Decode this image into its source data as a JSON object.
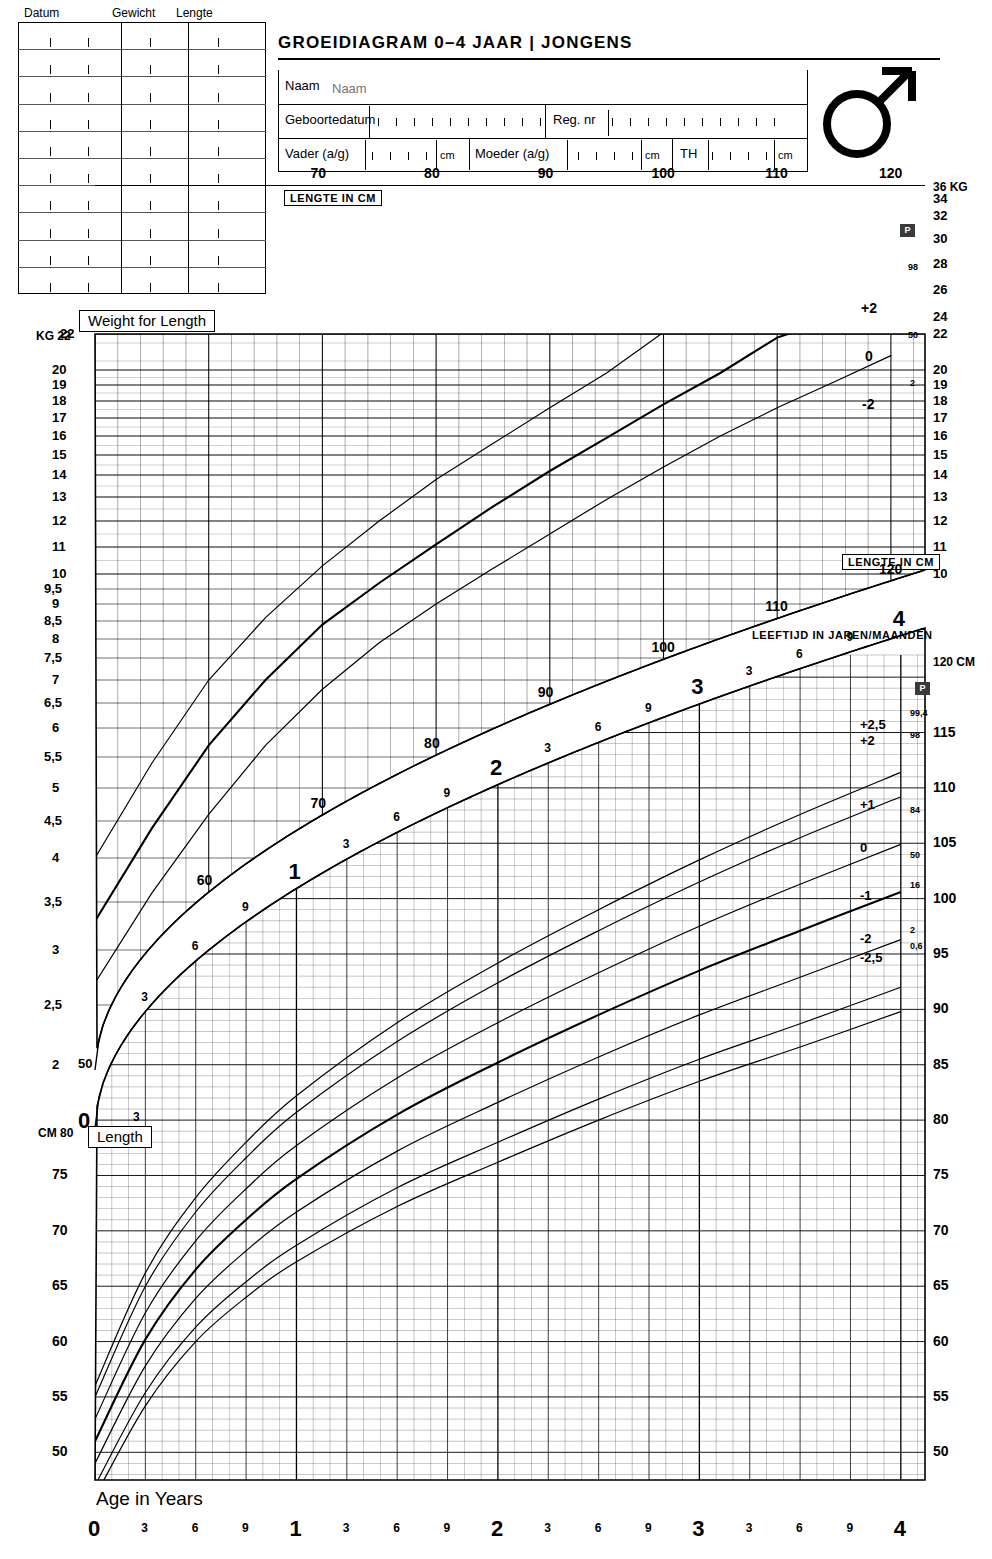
{
  "header": {
    "title": "GROEIDIAGRAM 0–4 JAAR  |  JONGENS",
    "sex_symbol": "male-symbol",
    "fields": [
      {
        "label": "Naam"
      },
      {
        "label": "Geboortedatum"
      },
      {
        "label": "Reg. nr"
      },
      {
        "label": "Vader (a/g)",
        "unit": "cm"
      },
      {
        "label": "Moeder (a/g)",
        "unit": "cm"
      },
      {
        "label": "TH",
        "unit": "cm"
      }
    ]
  },
  "record_table": {
    "columns": [
      "Datum",
      "Gewicht",
      "Lengte"
    ],
    "rows": 10,
    "values": []
  },
  "labels": {
    "weight_for_length": "Weight for Length",
    "length": "Length",
    "age_in_years": "Age in Years",
    "lengte_in_cm": "LENGTE IN CM",
    "leeftijd": "LEEFTIJD IN JAREN/MAANDEN",
    "p_badge": "P",
    "kg_unit": "KG",
    "cm_unit": "CM",
    "kg_top": "36 KG",
    "cm_top": "120 CM",
    "cm_left": "CM 80",
    "kg_left": "KG 22"
  },
  "chart_data": {
    "type": "line",
    "title": "GROEIDIAGRAM 0–4 JAAR | JONGENS",
    "panels": [
      {
        "name": "weight-for-length",
        "title": "Weight for Length",
        "xlabel": "LENGTE IN CM",
        "ylabel": "KG",
        "xlim": [
          50,
          123
        ],
        "xticks": [
          70,
          80,
          90,
          100,
          110,
          120
        ],
        "ytick_labels": [
          "2",
          "2,5",
          "3",
          "3,5",
          "4",
          "4,5",
          "5",
          "5,5",
          "6",
          "6,5",
          "7",
          "7,5",
          "8",
          "8,5",
          "9",
          "9,5",
          "10",
          "11",
          "12",
          "13",
          "14",
          "15",
          "16",
          "17",
          "18",
          "19",
          "20",
          "22"
        ],
        "ytick_right": [
          "10",
          "11",
          "12",
          "13",
          "14",
          "15",
          "16",
          "17",
          "18",
          "19",
          "20",
          "22",
          "24",
          "26",
          "28",
          "30",
          "32",
          "34",
          "36"
        ],
        "series": [
          {
            "name": "+2",
            "percentile": "98",
            "x": [
              50,
              55,
              60,
              65,
              70,
              75,
              80,
              85,
              90,
              95,
              100,
              105,
              110,
              115,
              120
            ],
            "y": [
              4.0,
              5.4,
              7.0,
              8.6,
              10.3,
              12.0,
              13.8,
              15.6,
              17.6,
              19.8,
              22.2,
              24.8,
              27.4,
              30.0,
              32.4
            ]
          },
          {
            "name": "0",
            "percentile": "50",
            "x": [
              50,
              55,
              60,
              65,
              70,
              75,
              80,
              85,
              90,
              95,
              100,
              105,
              110,
              115,
              120
            ],
            "y": [
              3.3,
              4.4,
              5.7,
              7.0,
              8.4,
              9.7,
              11.1,
              12.6,
              14.2,
              15.9,
              17.8,
              19.8,
              21.8,
              23.8,
              25.8
            ]
          },
          {
            "name": "-2",
            "percentile": "2",
            "x": [
              50,
              55,
              60,
              65,
              70,
              75,
              80,
              85,
              90,
              95,
              100,
              105,
              110,
              115,
              120
            ],
            "y": [
              2.7,
              3.6,
              4.6,
              5.7,
              6.8,
              7.9,
              9.0,
              10.2,
              11.5,
              12.9,
              14.4,
              16.0,
              17.6,
              19.2,
              20.8
            ]
          }
        ]
      },
      {
        "name": "length-for-age",
        "title": "Length",
        "xlabel": "Age in Years",
        "ylabel": "CM",
        "xlim": [
          0,
          4
        ],
        "xticks": [
          0,
          0.25,
          0.5,
          0.75,
          1,
          1.25,
          1.5,
          1.75,
          2,
          2.25,
          2.5,
          2.75,
          3,
          3.25,
          3.5,
          3.75,
          4
        ],
        "xtick_labels": [
          "0",
          "3",
          "6",
          "9",
          "1",
          "3",
          "6",
          "9",
          "2",
          "3",
          "6",
          "9",
          "3",
          "3",
          "6",
          "9",
          "4"
        ],
        "ylim": [
          47,
          122
        ],
        "yticks_left": [
          50,
          55,
          60,
          65,
          70,
          75,
          80
        ],
        "yticks_right": [
          50,
          55,
          60,
          65,
          70,
          75,
          80,
          85,
          90,
          95,
          100,
          105,
          110,
          115,
          120
        ],
        "series": [
          {
            "name": "+2,5",
            "percentile": "99,4",
            "x": [
              0,
              0.25,
              0.5,
              0.75,
              1,
              1.5,
              2,
              2.5,
              3,
              3.5,
              4
            ],
            "y": [
              56.0,
              66.2,
              73.0,
              78.0,
              82.2,
              88.8,
              94.2,
              99.0,
              103.5,
              107.6,
              111.4
            ]
          },
          {
            "name": "+2",
            "percentile": "98",
            "x": [
              0,
              0.25,
              0.5,
              0.75,
              1,
              1.5,
              2,
              2.5,
              3,
              3.5,
              4
            ],
            "y": [
              55.0,
              65.0,
              71.7,
              76.6,
              80.7,
              87.1,
              92.4,
              97.1,
              101.5,
              105.5,
              109.2
            ]
          },
          {
            "name": "+1",
            "percentile": "84",
            "x": [
              0,
              0.25,
              0.5,
              0.75,
              1,
              1.5,
              2,
              2.5,
              3,
              3.5,
              4
            ],
            "y": [
              53.0,
              62.6,
              69.1,
              73.8,
              77.7,
              83.8,
              88.8,
              93.3,
              97.5,
              101.3,
              104.9
            ]
          },
          {
            "name": "0",
            "percentile": "50",
            "x": [
              0,
              0.25,
              0.5,
              0.75,
              1,
              1.5,
              2,
              2.5,
              3,
              3.5,
              4
            ],
            "y": [
              51.0,
              60.2,
              66.5,
              71.0,
              74.7,
              80.5,
              85.2,
              89.5,
              93.5,
              97.1,
              100.6
            ]
          },
          {
            "name": "-1",
            "percentile": "16",
            "x": [
              0,
              0.25,
              0.5,
              0.75,
              1,
              1.5,
              2,
              2.5,
              3,
              3.5,
              4
            ],
            "y": [
              49.0,
              57.8,
              63.9,
              68.2,
              71.7,
              77.2,
              81.6,
              85.7,
              89.5,
              92.9,
              96.3
            ]
          },
          {
            "name": "-2",
            "percentile": "2",
            "x": [
              0,
              0.25,
              0.5,
              0.75,
              1,
              1.5,
              2,
              2.5,
              3,
              3.5,
              4
            ],
            "y": [
              47.0,
              55.4,
              61.3,
              65.4,
              68.7,
              73.9,
              78.0,
              81.9,
              85.5,
              88.7,
              92.0
            ]
          },
          {
            "name": "-2,5",
            "percentile": "0,6",
            "x": [
              0,
              0.25,
              0.5,
              0.75,
              1,
              1.5,
              2,
              2.5,
              3,
              3.5,
              4
            ],
            "y": [
              46.0,
              54.2,
              60.0,
              64.0,
              67.2,
              72.2,
              76.2,
              80.0,
              83.5,
              86.6,
              89.8
            ]
          }
        ]
      }
    ],
    "age_band": {
      "label": "LEEFTIJD IN JAREN/MAANDEN",
      "marks": [
        "3",
        "6",
        "9",
        "1",
        "3",
        "6",
        "9",
        "2",
        "3",
        "6",
        "9",
        "3",
        "3",
        "6",
        "9",
        "4"
      ]
    },
    "length_band": {
      "label": "LENGTE IN CM",
      "marks": [
        "50",
        "60",
        "70",
        "80",
        "90",
        "100",
        "110",
        "120"
      ]
    }
  },
  "sd_labels_weight": [
    "+2",
    "0",
    "-2"
  ],
  "pct_labels_weight": [
    "98",
    "50",
    "2"
  ],
  "sd_labels_length": [
    "+2,5",
    "+2",
    "+1",
    "0",
    "-1",
    "-2",
    "-2,5"
  ],
  "pct_labels_length": [
    "99,4",
    "98",
    "84",
    "50",
    "16",
    "2",
    "0,6"
  ]
}
